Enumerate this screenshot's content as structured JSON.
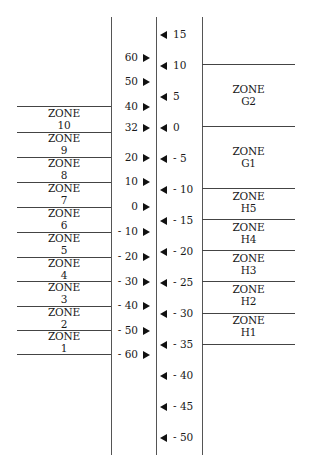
{
  "diagram": {
    "left_scale": {
      "ticks": [
        "60",
        "50",
        "40",
        "32",
        "20",
        "10",
        "0",
        "- 10",
        "- 20",
        "- 30",
        "- 40",
        "- 50",
        "- 60"
      ],
      "tick_y": [
        57,
        81,
        106,
        127,
        157,
        181,
        206,
        231,
        256,
        281,
        305,
        330,
        354
      ]
    },
    "right_scale": {
      "ticks": [
        "15",
        "10",
        "5",
        "0",
        "- 5",
        "- 10",
        "- 15",
        "- 20",
        "- 25",
        "- 30",
        "- 35",
        "- 40",
        "- 45",
        "- 50"
      ],
      "tick_y": [
        34,
        65,
        96,
        127,
        158,
        189,
        220,
        251,
        282,
        313,
        344,
        375,
        406,
        437
      ]
    },
    "left_zones": [
      {
        "word": "ZONE",
        "id": "10"
      },
      {
        "word": "ZONE",
        "id": "9"
      },
      {
        "word": "ZONE",
        "id": "8"
      },
      {
        "word": "ZONE",
        "id": "7"
      },
      {
        "word": "ZONE",
        "id": "6"
      },
      {
        "word": "ZONE",
        "id": "5"
      },
      {
        "word": "ZONE",
        "id": "4"
      },
      {
        "word": "ZONE",
        "id": "3"
      },
      {
        "word": "ZONE",
        "id": "2"
      },
      {
        "word": "ZONE",
        "id": "1"
      }
    ],
    "right_zones": [
      {
        "word": "ZONE",
        "id": "G2"
      },
      {
        "word": "ZONE",
        "id": "G1"
      },
      {
        "word": "ZONE",
        "id": "H5"
      },
      {
        "word": "ZONE",
        "id": "H4"
      },
      {
        "word": "ZONE",
        "id": "H3"
      },
      {
        "word": "ZONE",
        "id": "H2"
      },
      {
        "word": "ZONE",
        "id": "H1"
      }
    ],
    "icons": {
      "left_marker": "triangle-right-icon",
      "right_marker": "triangle-left-icon"
    }
  }
}
